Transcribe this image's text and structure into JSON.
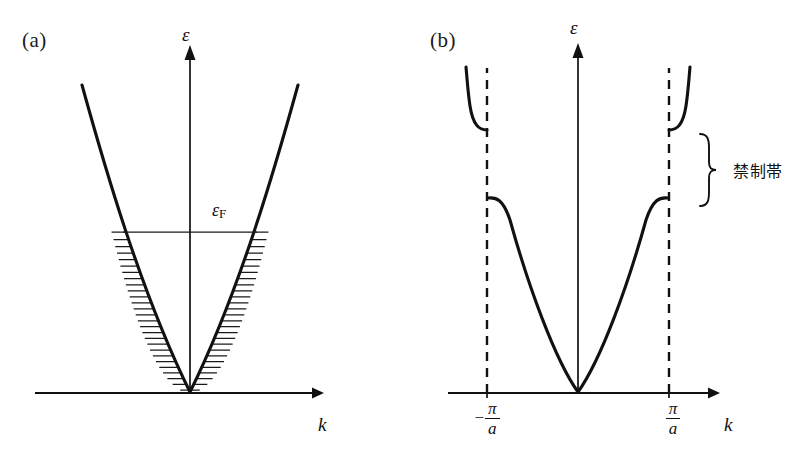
{
  "figure": {
    "background_color": "#ffffff",
    "ink_color": "#111111",
    "width": 791,
    "height": 467
  },
  "panels": [
    {
      "id": "a",
      "label": "(a)",
      "description": "free-electron parabolic dispersion with filled states below the Fermi level",
      "y_axis_label": "ε",
      "x_axis_label": "k",
      "fermi_label_symbol": "ε",
      "fermi_label_subscript": "F",
      "origin": {
        "x": 190,
        "y": 393
      },
      "axis": {
        "x_start": 35,
        "x_end": 322,
        "y_top": 46,
        "y_baseline": 393
      },
      "parabola": {
        "vertex_x": 190,
        "vertex_y": 393,
        "half_width_at_top": 110,
        "top_y": 85
      },
      "filled_levels": {
        "count": 27,
        "top_y": 232,
        "bottom_y": 390,
        "note": "horizontal lines filling the parabola up to the Fermi energy"
      }
    },
    {
      "id": "b",
      "label": "(b)",
      "description": "nearly-free-electron bands showing an energy gap at the Brillouin zone boundary",
      "y_axis_label": "ε",
      "x_axis_label": "k",
      "origin": {
        "x": 578,
        "y": 393
      },
      "axis": {
        "x_start": 448,
        "x_end": 718,
        "y_top": 44,
        "y_baseline": 393
      },
      "zone_boundaries": [
        {
          "side": "left",
          "x": 487,
          "tick_sign": "−",
          "numerator": "π",
          "denominator": "a"
        },
        {
          "side": "right",
          "x": 669,
          "tick_sign": "",
          "numerator": "π",
          "denominator": "a"
        }
      ],
      "gap": {
        "annotation_text": "禁制帯",
        "lower_band_edge_y": 198,
        "upper_band_edge_y": 130,
        "brace_top_y": 134,
        "brace_bottom_y": 206
      },
      "bands": [
        {
          "name": "lower-band",
          "flat_edge_y": 198,
          "vertex_y": 393
        },
        {
          "name": "upper-band",
          "flat_edge_y": 130,
          "top_y": 66
        }
      ]
    }
  ]
}
